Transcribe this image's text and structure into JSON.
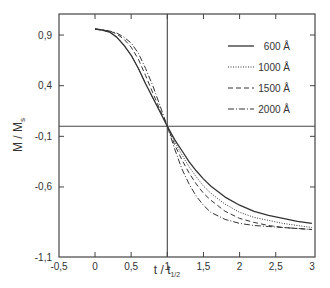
{
  "chart_data": {
    "type": "line",
    "title": "",
    "xlabel": "t / t_1/2",
    "xlabel_main": "t / t",
    "xlabel_sub": "1/2",
    "ylabel": "M / M_s",
    "ylabel_main": "M / M",
    "ylabel_sub": "s",
    "xlim": [
      -0.5,
      3
    ],
    "ylim": [
      -1.1,
      1.05
    ],
    "xticks": [
      -0.5,
      0,
      0.5,
      1,
      1.5,
      2,
      2.5,
      3
    ],
    "xtick_labels": [
      "-0,5",
      "0",
      "0,5",
      "1",
      "1,5",
      "2",
      "2,5",
      "3"
    ],
    "yticks": [
      0.9,
      0.4,
      -0.1,
      -0.6,
      -1.1
    ],
    "ytick_labels": [
      "0,9",
      "0,4",
      "-0,1",
      "-0,6",
      "-1,1"
    ],
    "grid": false,
    "reference_lines": {
      "horizontal_y": 0,
      "vertical_x": 1
    },
    "legend_position": "upper right",
    "series": [
      {
        "name": "600 Å",
        "style": "solid",
        "x": [
          0,
          0.1,
          0.2,
          0.3,
          0.4,
          0.5,
          0.6,
          0.7,
          0.8,
          0.9,
          1.0,
          1.1,
          1.2,
          1.3,
          1.4,
          1.5,
          1.6,
          1.8,
          2.0,
          2.2,
          2.4,
          2.6,
          2.8,
          3.0
        ],
        "y": [
          0.96,
          0.95,
          0.93,
          0.88,
          0.8,
          0.7,
          0.57,
          0.42,
          0.28,
          0.14,
          0.0,
          -0.13,
          -0.24,
          -0.35,
          -0.44,
          -0.52,
          -0.59,
          -0.7,
          -0.78,
          -0.84,
          -0.88,
          -0.91,
          -0.94,
          -0.96
        ]
      },
      {
        "name": "1000 Å",
        "style": "dotted",
        "x": [
          0,
          0.1,
          0.2,
          0.3,
          0.4,
          0.5,
          0.6,
          0.7,
          0.8,
          0.9,
          1.0,
          1.1,
          1.2,
          1.3,
          1.4,
          1.5,
          1.6,
          1.8,
          2.0,
          2.2,
          2.4,
          2.6,
          2.8,
          3.0
        ],
        "y": [
          0.96,
          0.95,
          0.93,
          0.88,
          0.8,
          0.7,
          0.57,
          0.42,
          0.28,
          0.14,
          0.0,
          -0.15,
          -0.28,
          -0.4,
          -0.5,
          -0.59,
          -0.66,
          -0.77,
          -0.85,
          -0.9,
          -0.93,
          -0.96,
          -0.98,
          -1.0
        ]
      },
      {
        "name": "1500 Å",
        "style": "dashed",
        "x": [
          0,
          0.1,
          0.2,
          0.3,
          0.4,
          0.5,
          0.6,
          0.7,
          0.8,
          0.9,
          1.0,
          1.1,
          1.2,
          1.3,
          1.4,
          1.5,
          1.6,
          1.8,
          2.0,
          2.2,
          2.4,
          2.6,
          2.8,
          3.0
        ],
        "y": [
          0.96,
          0.95,
          0.94,
          0.91,
          0.86,
          0.78,
          0.66,
          0.5,
          0.33,
          0.16,
          0.0,
          -0.18,
          -0.33,
          -0.46,
          -0.57,
          -0.66,
          -0.73,
          -0.84,
          -0.91,
          -0.95,
          -0.98,
          -1.0,
          -1.01,
          -1.02
        ]
      },
      {
        "name": "2000 Å",
        "style": "dash-dot",
        "x": [
          0,
          0.1,
          0.2,
          0.3,
          0.4,
          0.5,
          0.6,
          0.7,
          0.8,
          0.9,
          1.0,
          1.1,
          1.2,
          1.3,
          1.4,
          1.5,
          1.6,
          1.8,
          2.0,
          2.2,
          2.4,
          2.6,
          2.8,
          3.0
        ],
        "y": [
          0.96,
          0.95,
          0.94,
          0.92,
          0.88,
          0.82,
          0.72,
          0.57,
          0.4,
          0.2,
          0.0,
          -0.22,
          -0.42,
          -0.57,
          -0.69,
          -0.78,
          -0.85,
          -0.92,
          -0.96,
          -0.98,
          -0.99,
          -1.0,
          -1.01,
          -1.02
        ]
      }
    ]
  },
  "layout": {
    "plot_left": 59,
    "plot_right": 315,
    "plot_top": 14,
    "plot_bottom": 257,
    "x_px_per_unit": 72.3,
    "x_origin_px": 95,
    "y_px_per_unit": 101.3,
    "y_origin_px": 126.2,
    "legend": {
      "x": 228,
      "y0": 46,
      "dy": 21
    }
  }
}
